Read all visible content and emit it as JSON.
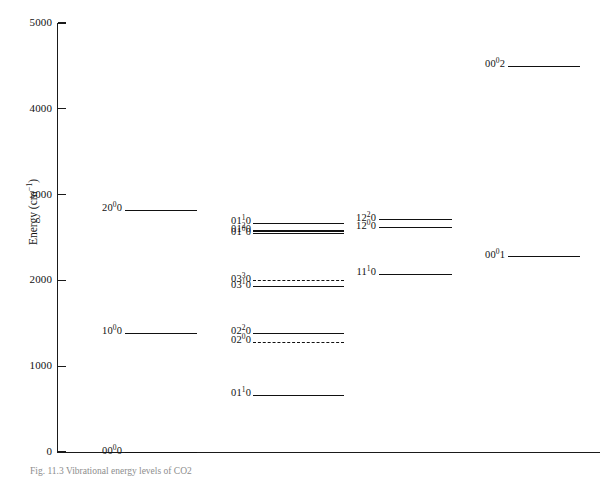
{
  "figure": {
    "caption": "Fig. 11.3   Vibrational energy levels of CO2"
  },
  "axes": {
    "y_title_main": "Energy (cm",
    "y_title_sup": "−1",
    "y_title_tail": ")",
    "y_ticks": [
      {
        "label": "5000",
        "value": 5000
      },
      {
        "label": "4000",
        "value": 4000
      },
      {
        "label": "3000",
        "value": 3000
      },
      {
        "label": "2000",
        "value": 2000
      },
      {
        "label": "1000",
        "value": 1000
      },
      {
        "label": "0",
        "value": 0
      }
    ]
  },
  "chart_data": {
    "type": "line",
    "title": "Vibrational energy levels of CO2",
    "xlabel": "",
    "ylabel": "Energy (cm-1)",
    "ylim": [
      0,
      5000
    ],
    "xlim": [
      0,
      1
    ],
    "grid": false,
    "legend": "none",
    "annotations": [
      "Energy level diagram: horizontal bars mark vibrational states grouped in four columns by polyad / vibrational quantum numbers."
    ],
    "series": [
      {
        "name": "column-1-symmetric-stretch",
        "levels": [
          {
            "label": "00",
            "sup": "0",
            "tail": "0",
            "full_label": "00⁰0",
            "value": 0,
            "style": "solid"
          },
          {
            "label": "10",
            "sup": "0",
            "tail": "0",
            "full_label": "10⁰0",
            "value": 1390,
            "style": "solid"
          },
          {
            "label": "20",
            "sup": "0",
            "tail": "0",
            "full_label": "20⁰0",
            "value": 2826,
            "style": "solid"
          }
        ]
      },
      {
        "name": "column-2-bending",
        "levels": [
          {
            "label": "01",
            "sup": "1",
            "tail": "0",
            "full_label": "01¹0",
            "value": 667,
            "style": "solid"
          },
          {
            "label": "02",
            "sup": "0",
            "tail": "0",
            "full_label": "02⁰0",
            "value": 1285,
            "style": "dashed"
          },
          {
            "label": "02",
            "sup": "2",
            "tail": "0",
            "full_label": "02²0",
            "value": 1388,
            "style": "solid"
          },
          {
            "label": "03",
            "sup": "1",
            "tail": "0",
            "full_label": "03¹0",
            "value": 1932,
            "style": "solid"
          },
          {
            "label": "03",
            "sup": "3",
            "tail": "0",
            "full_label": "03³0",
            "value": 2003,
            "style": "dashed"
          },
          {
            "label": "01",
            "sup": "0",
            "tail": "0",
            "full_label": "01⁰0",
            "value": 2548,
            "style": "solid"
          },
          {
            "label": "01",
            "sup": "2",
            "tail": "0",
            "full_label": "01²0",
            "value": 2585,
            "style": "thick"
          },
          {
            "label": "01",
            "sup": "1",
            "tail": "0",
            "full_label": "01¹0",
            "value": 2672,
            "style": "solid"
          }
        ]
      },
      {
        "name": "column-3-combination",
        "levels": [
          {
            "label": "11",
            "sup": "1",
            "tail": "0",
            "full_label": "11¹0",
            "value": 2077,
            "style": "solid"
          },
          {
            "label": "12",
            "sup": "0",
            "tail": "0",
            "full_label": "12⁰0",
            "value": 2620,
            "style": "solid"
          },
          {
            "label": "12",
            "sup": "2",
            "tail": "0",
            "full_label": "12²0",
            "value": 2713,
            "style": "solid"
          }
        ]
      },
      {
        "name": "column-4-asymmetric-stretch",
        "levels": [
          {
            "label": "00",
            "sup": "0",
            "tail": "1",
            "full_label": "00⁰1",
            "value": 2280,
            "style": "solid"
          },
          {
            "label": "00",
            "sup": "0",
            "tail": "2",
            "full_label": "00⁰2",
            "value": 4500,
            "style": "solid"
          }
        ]
      }
    ]
  },
  "layout": {
    "columns": [
      {
        "name": "column-1-symmetric-stretch",
        "line_left": 125,
        "line_right": 197,
        "label_right": 122
      },
      {
        "name": "column-2-bending",
        "line_left": 253,
        "line_right": 344,
        "label_right": 251
      },
      {
        "name": "column-3-combination",
        "line_left": 379,
        "line_right": 452,
        "label_right": 376
      },
      {
        "name": "column-4-asymmetric-stretch",
        "line_left": 508,
        "line_right": 580,
        "label_right": 505
      }
    ],
    "plot": {
      "x0": 57,
      "y0": 452,
      "y_top": 23,
      "y_value_top": 5000
    }
  }
}
